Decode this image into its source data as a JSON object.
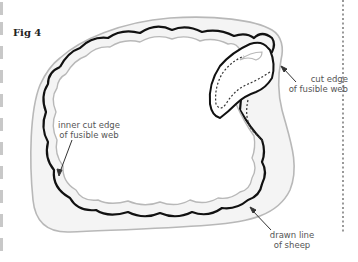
{
  "figure": {
    "label": "Fig 4"
  },
  "annotations": {
    "cut_edge": {
      "line1": "cut edge",
      "line2": "of fusible web"
    },
    "inner_cut_edge": {
      "line1": "inner cut edge",
      "line2": "of fusible web"
    },
    "drawn_line": {
      "line1": "drawn line",
      "line2": "of sheep"
    }
  },
  "colors": {
    "outer_cut_line": "#b8b8b8",
    "fusible_web_fill": "#f4f4f4",
    "drawn_line": "#111111",
    "inner_cut_line": "#b8b8b8",
    "dotted_line": "#333333",
    "page_margin_dashes": "#c8c8c8",
    "annotation_text": "#555555"
  }
}
